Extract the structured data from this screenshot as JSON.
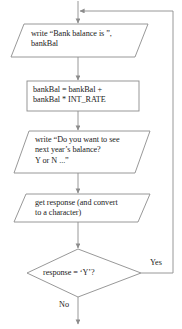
{
  "diagram": {
    "type": "flowchart",
    "colors": {
      "background": "#ffffff",
      "stroke": "#8c8c8c",
      "text": "#1a1a1a"
    },
    "nodes": [
      {
        "id": "io-write-balance",
        "shape": "parallelogram",
        "role": "output",
        "text": "write “Bank balance is ”,\nbankBal"
      },
      {
        "id": "process-interest",
        "shape": "rectangle",
        "role": "process",
        "text": "bankBal = bankBal +\nbankBal * INT_RATE"
      },
      {
        "id": "io-prompt-continue",
        "shape": "parallelogram",
        "role": "output",
        "text": "write “Do you want to see\nnext year’s balance?\nY or N ...”"
      },
      {
        "id": "io-get-response",
        "shape": "parallelogram",
        "role": "input",
        "text": "get response (and convert\nto a character)"
      },
      {
        "id": "decision-response",
        "shape": "diamond",
        "role": "decision",
        "text": "response = ‘Y’?"
      }
    ],
    "edge_labels": {
      "yes": "Yes",
      "no": "No"
    }
  }
}
